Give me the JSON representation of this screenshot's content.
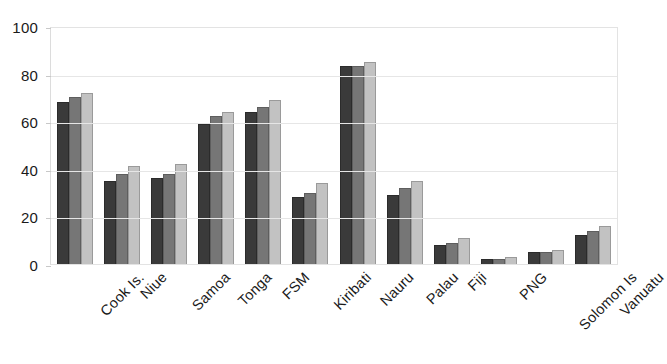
{
  "chart_data": {
    "type": "bar",
    "title": "",
    "subtitle": "",
    "xlabel": "",
    "ylabel": "",
    "ylim": [
      0,
      100
    ],
    "y_ticks": [
      0,
      20,
      40,
      60,
      80,
      100
    ],
    "y_tick_labels": [
      "0",
      "20",
      "40",
      "60",
      "80",
      "100"
    ],
    "grid": true,
    "legend": "none",
    "categories": [
      "Cook Is.",
      "Niue",
      "Samoa",
      "Tonga",
      "FSM",
      "Kiribati",
      "Nauru",
      "Palau",
      "Fiji",
      "PNG",
      "Solomon Is",
      "Vanuatu"
    ],
    "series": [
      {
        "name": "Series 1",
        "color": "#3a3a3a",
        "values": [
          68,
          35,
          36,
          59,
          64,
          28,
          83,
          29,
          8,
          2,
          5,
          12
        ]
      },
      {
        "name": "Series 2",
        "color": "#767676",
        "values": [
          70,
          38,
          38,
          62,
          66,
          30,
          83,
          32,
          9,
          2,
          5,
          14
        ]
      },
      {
        "name": "Series 3",
        "color": "#c2c2c2",
        "values": [
          72,
          41,
          42,
          64,
          69,
          34,
          85,
          35,
          11,
          3,
          6,
          16
        ]
      }
    ]
  }
}
